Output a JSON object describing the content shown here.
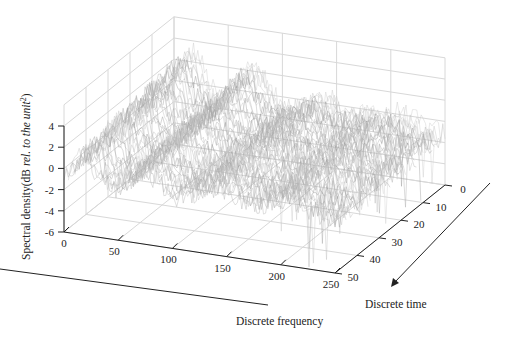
{
  "chart_data": {
    "type": "surface3d",
    "title": "",
    "xlabel": "Discrete frequency",
    "ylabel": "Discrete time",
    "zlabel": "Spectral density(dB rel. to the unit²)",
    "zlabel_parts": {
      "main": "Spectral density(dB ",
      "italic": "rel. to the unit",
      "sup": "2",
      "close": ")"
    },
    "x_ticks": [
      0,
      50,
      100,
      150,
      200,
      250
    ],
    "y_ticks": [
      0,
      10,
      20,
      30,
      40,
      50
    ],
    "z_ticks": [
      4,
      2,
      0,
      -2,
      -4,
      -6
    ],
    "xlim": [
      0,
      250
    ],
    "ylim": [
      0,
      50
    ],
    "zlim": [
      -6,
      4
    ],
    "grid": true,
    "style": "gray mesh/waterfall"
  },
  "arrows": {
    "frequency_direction": "Discrete frequency",
    "time_direction": "Discrete time"
  }
}
